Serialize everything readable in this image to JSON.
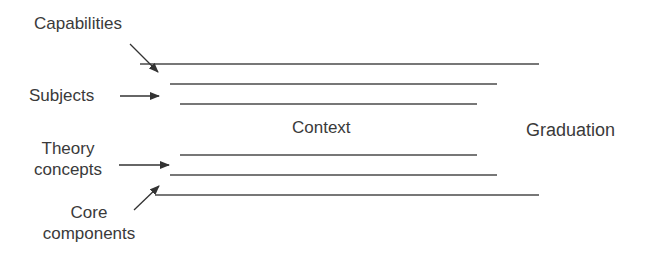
{
  "diagram": {
    "labels": {
      "capabilities": "Capabilities",
      "subjects": "Subjects",
      "theory_line1": "Theory",
      "theory_line2": "concepts",
      "core_line1": "Core",
      "core_line2": "components",
      "context": "Context",
      "graduation": "Graduation"
    },
    "colors": {
      "line": "#4a4a4a",
      "text": "#3a3a3a",
      "background": "#ffffff"
    },
    "lines": [
      {
        "name": "capabilities-line",
        "x1": 140,
        "x2": 539,
        "y": 64
      },
      {
        "name": "subjects-line",
        "x1": 170,
        "x2": 497,
        "y": 84
      },
      {
        "name": "upper-inner-line",
        "x1": 180,
        "x2": 477,
        "y": 104
      },
      {
        "name": "lower-inner-line",
        "x1": 180,
        "x2": 477,
        "y": 155
      },
      {
        "name": "theory-concepts-line",
        "x1": 170,
        "x2": 497,
        "y": 175
      },
      {
        "name": "core-components-line",
        "x1": 155,
        "x2": 539,
        "y": 195
      }
    ]
  }
}
